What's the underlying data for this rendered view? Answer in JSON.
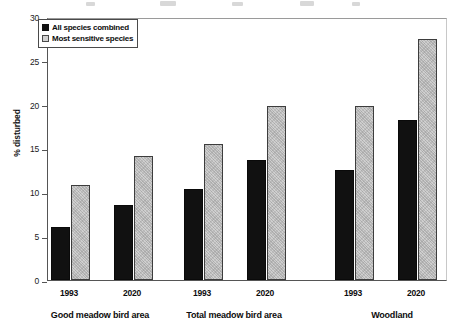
{
  "chart_data": {
    "type": "bar",
    "title": "",
    "xlabel": "",
    "ylabel": "% disturbed",
    "ylim": [
      0,
      30
    ],
    "yticks": [
      0,
      5,
      10,
      15,
      20,
      25,
      30
    ],
    "ytick_labels": [
      "0",
      "5",
      "10",
      "15",
      "20",
      "25",
      "30"
    ],
    "grid": false,
    "legend_position": "top-left",
    "groups": [
      {
        "name": "Good meadow bird area",
        "years": [
          "1993",
          "2020"
        ]
      },
      {
        "name": "Total meadow bird area",
        "years": [
          "1993",
          "2020"
        ]
      },
      {
        "name": "Woodland",
        "years": [
          "1993",
          "2020"
        ]
      }
    ],
    "categories": [
      "Good meadow bird area 1993",
      "Good meadow bird area 2020",
      "Total meadow bird area 1993",
      "Total meadow bird area 2020",
      "Woodland 1993",
      "Woodland 2020"
    ],
    "series": [
      {
        "name": "All species combined",
        "color": "#111111",
        "values": [
          6.1,
          8.6,
          10.4,
          13.7,
          12.5,
          18.2
        ]
      },
      {
        "name": "Most sensitive species",
        "color": "#cfcfcf",
        "values": [
          10.8,
          14.2,
          15.5,
          19.8,
          19.8,
          27.5
        ]
      }
    ]
  },
  "legend": {
    "items": [
      {
        "label": "All species combined",
        "swatch": "black"
      },
      {
        "label": "Most sensitive species",
        "swatch": "grey"
      }
    ]
  },
  "axis": {
    "y_title": "% disturbed",
    "y_labels": [
      "30",
      "25",
      "20",
      "15",
      "10",
      "5",
      "0"
    ]
  },
  "x_axis": {
    "year_labels": [
      "1993",
      "2020",
      "1993",
      "2020",
      "1993",
      "2020"
    ],
    "group_labels": [
      "Good meadow bird area",
      "Total meadow bird area",
      "Woodland"
    ]
  }
}
